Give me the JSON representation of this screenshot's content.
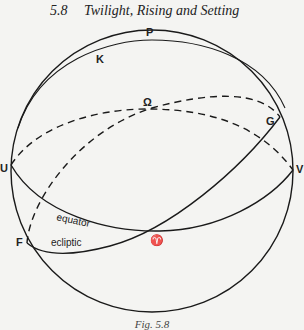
{
  "header": {
    "section_number": "5.8",
    "section_title": "Twilight, Rising and Setting"
  },
  "figure": {
    "labels": {
      "P": "P",
      "K": "K",
      "Omega": "Ω",
      "G": "G",
      "U": "U",
      "V": "V",
      "F": "F",
      "aries": "♈",
      "equator": "equator",
      "ecliptic": "ecliptic"
    },
    "colors": {
      "line": "#1a1a1a",
      "background": "#f4f4f2"
    }
  },
  "caption": {
    "text": "Fig. 5.8"
  }
}
